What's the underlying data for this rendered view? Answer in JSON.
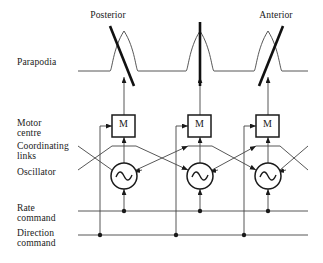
{
  "figure": {
    "type": "block-diagram",
    "title_top_left": "Posterior",
    "title_top_right": "Anterior"
  },
  "row_labels": {
    "parapodia": "Parapodia",
    "motor_centre_line1": "Motor",
    "motor_centre_line2": "centre",
    "coordinating_links_line1": "Coordinating",
    "coordinating_links_line2": "links",
    "oscillator": "Oscillator",
    "rate_command_line1": "Rate",
    "rate_command_line2": "command",
    "direction_command_line1": "Direction",
    "direction_command_line2": "command"
  },
  "direction_labels": {
    "posterior": "Posterior",
    "anterior": "Anterior"
  },
  "units": [
    {
      "id": "unit-1",
      "motor_label": "M",
      "oscillator_glyph": "sine-wave",
      "parapodium_tilt": "backward"
    },
    {
      "id": "unit-2",
      "motor_label": "M",
      "oscillator_glyph": "sine-wave",
      "parapodium_tilt": "vertical"
    },
    {
      "id": "unit-3",
      "motor_label": "M",
      "oscillator_glyph": "sine-wave",
      "parapodium_tilt": "forward"
    }
  ],
  "colors": {
    "ink": "#1a1a1a",
    "line": "#444444",
    "heavy": "#111111",
    "background": "#ffffff"
  }
}
